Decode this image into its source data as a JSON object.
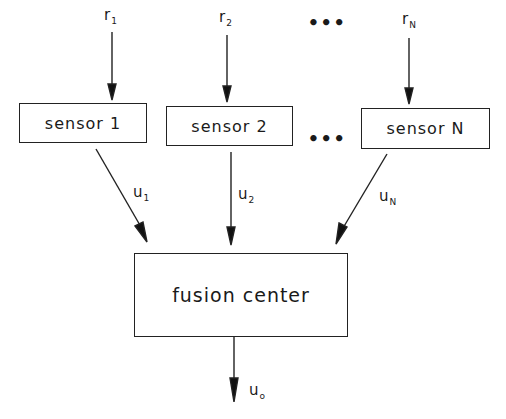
{
  "diagram": {
    "inputs": [
      {
        "symbol": "r",
        "sub": "1"
      },
      {
        "symbol": "r",
        "sub": "2"
      },
      {
        "symbol": "r",
        "sub": "N"
      }
    ],
    "sensors": [
      {
        "label": "sensor 1"
      },
      {
        "label": "sensor 2"
      },
      {
        "label": "sensor N"
      }
    ],
    "outputs": [
      {
        "symbol": "u",
        "sub": "1"
      },
      {
        "symbol": "u",
        "sub": "2"
      },
      {
        "symbol": "u",
        "sub": "N"
      }
    ],
    "ellipsis": "•••",
    "fusion": {
      "label": "fusion center"
    },
    "final_output": {
      "symbol": "u",
      "sub": "o"
    }
  }
}
